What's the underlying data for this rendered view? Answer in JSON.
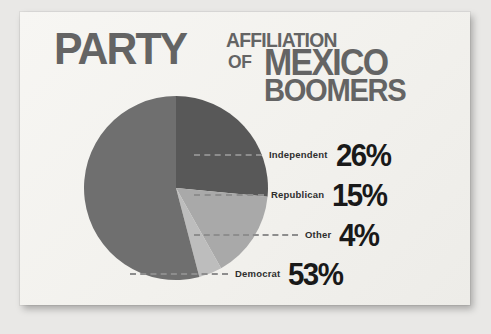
{
  "card": {
    "background_color": "#f5f4f1",
    "page_background_color": "#e9e8e6"
  },
  "headline": {
    "line1": "PARTY",
    "line2": "AFFILIATION",
    "line3": "OF",
    "line4": "MEXICO",
    "line5": "BOOMERS",
    "color": "#646464"
  },
  "legend": {
    "rows": [
      {
        "label": "Independent",
        "value": "26%"
      },
      {
        "label": "Republican",
        "value": "15%"
      },
      {
        "label": "Other",
        "value": "4%"
      },
      {
        "label": "Democrat",
        "value": "53%"
      }
    ]
  },
  "chart_data": {
    "type": "pie",
    "title": "PARTY AFFILIATION OF MEXICO BOOMERS",
    "categories": [
      "Independent",
      "Republican",
      "Other",
      "Democrat"
    ],
    "values": [
      26,
      15,
      4,
      53
    ],
    "value_labels": [
      "26%",
      "15%",
      "4%",
      "53%"
    ],
    "unit": "percent",
    "total": 98,
    "start_angle_deg": 0,
    "direction": "clockwise",
    "colors": [
      "#585858",
      "#a9a9a9",
      "#bdbdbd",
      "#6f6f6f"
    ],
    "legend_position": "right",
    "grid": false,
    "leader_lines": true,
    "leader_line_color": "#8d8d8d"
  }
}
